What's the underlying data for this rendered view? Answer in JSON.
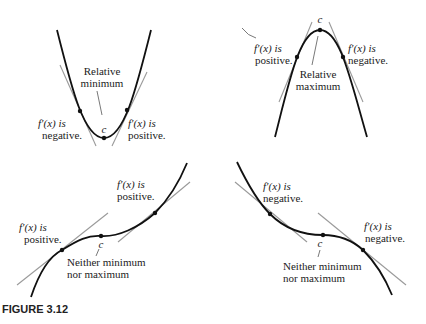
{
  "caption": "FIGURE 3.12",
  "colors": {
    "curve": "#111111",
    "tangent": "#9a9a9a",
    "text": "#222222",
    "background": "#ffffff"
  },
  "panels": [
    {
      "id": "relative-minimum",
      "labels": {
        "extremum_line1": "Relative",
        "extremum_line2": "minimum",
        "left_line1": "f′(x) is",
        "left_line2": "negative.",
        "right_line1": "f′(x) is",
        "right_line2": "positive.",
        "critical": "c"
      }
    },
    {
      "id": "relative-maximum",
      "labels": {
        "extremum_line1": "Relative",
        "extremum_line2": "maximum",
        "left_line1": "f′(x) is",
        "left_line2": "positive.",
        "right_line1": "f′(x) is",
        "right_line2": "negative.",
        "critical": "c"
      }
    },
    {
      "id": "increasing-inflection",
      "labels": {
        "neither_line1": "Neither minimum",
        "neither_line2": "nor maximum",
        "left_line1": "f′(x) is",
        "left_line2": "positive.",
        "right_line1": "f′(x) is",
        "right_line2": "positive.",
        "critical": "c"
      }
    },
    {
      "id": "decreasing-inflection",
      "labels": {
        "neither_line1": "Neither minimum",
        "neither_line2": "nor maximum",
        "left_line1": "f′(x) is",
        "left_line2": "negative.",
        "right_line1": "f′(x) is",
        "right_line2": "negative.",
        "critical": "c"
      }
    }
  ]
}
